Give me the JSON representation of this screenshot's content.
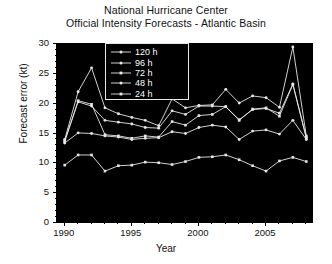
{
  "title": {
    "line1": "National Hurricane Center",
    "line2": "Official Intensity Forecasts - Atlantic Basin"
  },
  "axes": {
    "xlabel": "Year",
    "ylabel": "Forecast error (kt)",
    "yticks": [
      "0",
      "5",
      "10",
      "15",
      "20",
      "25",
      "30"
    ],
    "xticks": [
      "1990",
      "1995",
      "2000",
      "2005"
    ]
  },
  "legend": {
    "items": [
      {
        "label": "120 h"
      },
      {
        "label": "96 h"
      },
      {
        "label": "72 h"
      },
      {
        "label": "48 h"
      },
      {
        "label": "24 h"
      }
    ]
  },
  "colors": {
    "plot_background": "#000000",
    "line": "#e6e6e6",
    "frame": "#000000",
    "text": "#111111",
    "legend_text": "#ffffff"
  },
  "chart_data": {
    "type": "line",
    "title": "National Hurricane Center\nOfficial Intensity Forecasts - Atlantic Basin",
    "xlabel": "Year",
    "ylabel": "Forecast error (kt)",
    "xlim": [
      1989.5,
      2008.5
    ],
    "ylim": [
      0,
      30
    ],
    "grid": false,
    "legend_position": "upper-center",
    "x": [
      1990,
      1991,
      1992,
      1993,
      1994,
      1995,
      1996,
      1997,
      1998,
      1999,
      2000,
      2001,
      2002,
      2003,
      2004,
      2005,
      2006,
      2007,
      2008
    ],
    "series": [
      {
        "name": "120 h",
        "values": [
          14.0,
          22.0,
          26.0,
          19.3,
          18.3,
          17.7,
          17.2,
          16.3,
          20.8,
          19.3,
          19.7,
          19.8,
          22.4,
          20.1,
          21.3,
          21.0,
          19.4,
          29.5,
          14.6
        ]
      },
      {
        "name": "96 h",
        "values": [
          13.8,
          20.3,
          19.6,
          17.2,
          16.9,
          16.6,
          16.0,
          15.9,
          18.8,
          18.2,
          19.6,
          19.6,
          19.5,
          17.3,
          19.0,
          19.2,
          18.4,
          23.3,
          14.4
        ]
      },
      {
        "name": "72 h",
        "values": [
          13.6,
          20.5,
          19.9,
          14.8,
          14.6,
          14.2,
          14.6,
          14.4,
          17.0,
          16.4,
          18.0,
          18.2,
          19.5,
          17.2,
          19.1,
          19.3,
          17.9,
          23.2,
          14.2
        ]
      },
      {
        "name": "48 h",
        "values": [
          13.4,
          15.1,
          15.0,
          14.6,
          14.4,
          14.0,
          14.2,
          14.3,
          15.3,
          15.0,
          16.0,
          16.4,
          16.1,
          14.0,
          15.4,
          15.6,
          14.9,
          17.2,
          14.0
        ]
      },
      {
        "name": "24 h",
        "values": [
          9.7,
          11.4,
          11.4,
          8.7,
          9.6,
          9.7,
          10.2,
          10.1,
          9.8,
          10.3,
          11.0,
          11.1,
          11.4,
          10.6,
          9.6,
          8.7,
          10.4,
          11.0,
          10.3
        ]
      }
    ]
  }
}
